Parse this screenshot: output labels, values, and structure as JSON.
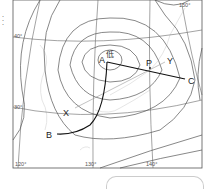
{
  "map": {
    "type": "weather-map",
    "latitude_labels": [
      "40°",
      "30°"
    ],
    "longitude_labels": [
      "120°",
      "130°",
      "140°",
      "150°"
    ],
    "low_pressure_symbol": "低",
    "points": {
      "A": "A",
      "B": "B",
      "C": "C",
      "P": "P",
      "X": "X",
      "Y": "Y"
    },
    "side_text": "・・・"
  },
  "colors": {
    "isobar": "#555555",
    "grid": "#666666",
    "front": "#111111",
    "coast": "#cccccc",
    "frame": "#555555"
  }
}
